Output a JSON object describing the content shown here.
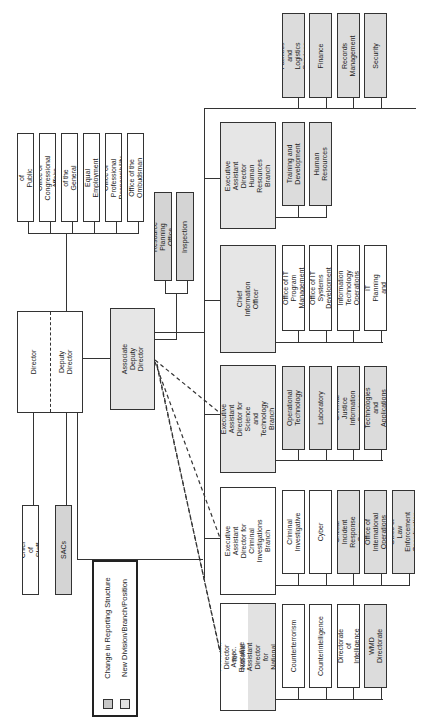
{
  "legend": {
    "items": [
      {
        "label": "Change in Reporting Structure",
        "color": "#c8c8c8"
      },
      {
        "label": "New Division/Branch/Position",
        "color": "#e2e2e2"
      }
    ]
  },
  "top": {
    "director": "Director",
    "deputy_director": "Deputy Director",
    "chief_of_staff": "Chief of Staff",
    "sacs": "SACs",
    "associate_deputy_director": "Associate\nDeputy Director"
  },
  "director_offices": [
    "Office of Public Affairs",
    "Office of Congressional\nAffairs",
    "Office of the\nGeneral Counsel",
    "Office of Equal Employment\nOpportunity",
    "Office of Professional\nResponsibility",
    "Office of the\nOmbudsman"
  ],
  "add_offices": [
    "Resource Planning Office",
    "Inspection"
  ],
  "branches": {
    "hr": {
      "head": "Executive Assistant\nDirector\nHuman Resources Branch",
      "units": [
        "Training and\nDevelopment",
        "Human Resources"
      ]
    },
    "admin_units": [
      "Facilities and Logistics\nServices",
      "Finance",
      "Records Management",
      "Security"
    ],
    "cio": {
      "head": "Chief Information Officer",
      "units": [
        "Office of IT Program\nManagement",
        "Office of IT Systems\nDevelopment",
        "Information Technology\nOperations",
        "Office of IT Planning\nand Policy"
      ]
    },
    "stb": {
      "head": "Executive Assistant\nDirector for\nScience and Technology Branch",
      "units": [
        "Operational Technology",
        "Laboratory",
        "Criminal Justice\nInformation Services",
        "Special Technologies\nand Applications Office"
      ]
    },
    "cib": {
      "head": "Executive Assistant\nDirector for\nCriminal Investigations Branch",
      "units": [
        "Criminal Investigative",
        "Cyber",
        "Critical Incident\nResponse Group",
        "Office of International\nOperations",
        "Office of Law\nEnforcement Coordination"
      ]
    },
    "nsb": {
      "head": "Executive Assistant Director\nfor National Security Branch",
      "assoc": "Assoc. Executive Assistant Director\nfor National Security Branch",
      "units": [
        "Counterterrorism",
        "Counterintelligence",
        "Directorate of\nIntelligence",
        "WMD Directorate"
      ]
    }
  }
}
